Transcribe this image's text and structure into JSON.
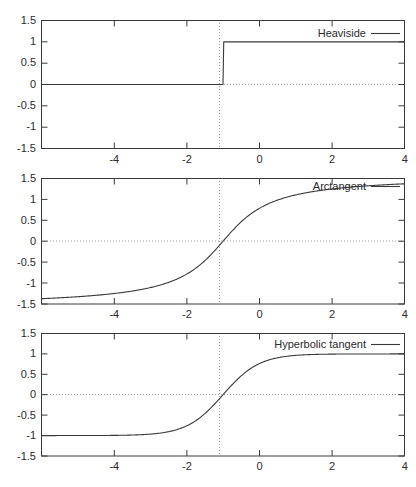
{
  "figure": {
    "width": 416,
    "height": 487,
    "background": "#ffffff",
    "line_color": "#3a3a3a",
    "grid_color": "#9a9a9a",
    "panel_count": 3
  },
  "chart_data": [
    {
      "type": "line",
      "title": "",
      "xlabel": "",
      "ylabel": "",
      "xlim": [
        -5,
        5
      ],
      "ylim": [
        -1.5,
        1.5
      ],
      "xticks": [
        -4,
        -2,
        0,
        2,
        4
      ],
      "xticklabels": [
        "-4",
        "-2",
        "0",
        "2",
        "4"
      ],
      "yticks": [
        -1.5,
        -1,
        -0.5,
        0,
        0.5,
        1,
        1.5
      ],
      "yticklabels": [
        "1.5",
        "1",
        "0.5",
        "0",
        "-0.5",
        "-1",
        "-1.5"
      ],
      "grid": "zero-lines-dotted",
      "legend_position": "top-right",
      "series": [
        {
          "name": "Heaviside",
          "function": "heaviside",
          "x": [
            -5,
            -0.02,
            0,
            0.02,
            5
          ],
          "values": [
            0,
            0,
            0,
            1,
            1
          ]
        }
      ]
    },
    {
      "type": "line",
      "title": "",
      "xlabel": "",
      "ylabel": "",
      "xlim": [
        -5,
        5
      ],
      "ylim": [
        -1.5,
        1.5
      ],
      "xticks": [
        -4,
        -2,
        0,
        2,
        4
      ],
      "xticklabels": [
        "-4",
        "-2",
        "0",
        "2",
        "4"
      ],
      "yticks": [
        -1.5,
        -1,
        -0.5,
        0,
        0.5,
        1,
        1.5
      ],
      "yticklabels": [
        "1.5",
        "1",
        "0.5",
        "0",
        "-0.5",
        "-1",
        "-1.5"
      ],
      "grid": "zero-lines-dotted",
      "legend_position": "top-right",
      "series": [
        {
          "name": "Arctangent",
          "function": "arctan",
          "x": [
            -5,
            -4.5,
            -4,
            -3.5,
            -3,
            -2.5,
            -2,
            -1.5,
            -1,
            -0.75,
            -0.5,
            -0.25,
            0,
            0.25,
            0.5,
            0.75,
            1,
            1.5,
            2,
            2.5,
            3,
            3.5,
            4,
            4.5,
            5
          ],
          "values": [
            -1.373,
            -1.352,
            -1.326,
            -1.292,
            -1.249,
            -1.19,
            -1.107,
            -0.983,
            -0.785,
            -0.644,
            -0.464,
            -0.245,
            0,
            0.245,
            0.464,
            0.644,
            0.785,
            0.983,
            1.107,
            1.19,
            1.249,
            1.292,
            1.326,
            1.352,
            1.373
          ]
        }
      ]
    },
    {
      "type": "line",
      "title": "",
      "xlabel": "",
      "ylabel": "",
      "xlim": [
        -5,
        5
      ],
      "ylim": [
        -1.5,
        1.5
      ],
      "xticks": [
        -4,
        -2,
        0,
        2,
        4
      ],
      "xticklabels": [
        "-4",
        "-2",
        "0",
        "2",
        "4"
      ],
      "yticks": [
        -1.5,
        -1,
        -0.5,
        0,
        0.5,
        1,
        1.5
      ],
      "yticklabels": [
        "1.5",
        "1",
        "0.5",
        "0",
        "-0.5",
        "-1",
        "-1.5"
      ],
      "grid": "zero-lines-dotted",
      "legend_position": "top-right",
      "series": [
        {
          "name": "Hyperbolic tangent",
          "function": "tanh",
          "x": [
            -5,
            -4.5,
            -4,
            -3.5,
            -3,
            -2.5,
            -2,
            -1.5,
            -1,
            -0.75,
            -0.5,
            -0.25,
            0,
            0.25,
            0.5,
            0.75,
            1,
            1.5,
            2,
            2.5,
            3,
            3.5,
            4,
            4.5,
            5
          ],
          "values": [
            -0.9999,
            -0.9998,
            -0.9993,
            -0.9982,
            -0.9951,
            -0.9866,
            -0.964,
            -0.9051,
            -0.7616,
            -0.6351,
            -0.4621,
            -0.2449,
            0,
            0.2449,
            0.4621,
            0.6351,
            0.7616,
            0.9051,
            0.964,
            0.9866,
            0.9951,
            0.9982,
            0.9993,
            0.9998,
            0.9999
          ]
        }
      ]
    }
  ],
  "panels": [
    {
      "id": "panel-heaviside",
      "legend_label": "Heaviside",
      "y_labels": [
        "1.5",
        "1",
        "0.5",
        "0",
        "-0.5",
        "-1",
        "-1.5"
      ],
      "x_labels": [
        "-4",
        "-2",
        "0",
        "2",
        "4"
      ]
    },
    {
      "id": "panel-arctangent",
      "legend_label": "Arctangent",
      "y_labels": [
        "1.5",
        "1",
        "0.5",
        "0",
        "-0.5",
        "-1",
        "-1.5"
      ],
      "x_labels": [
        "-4",
        "-2",
        "0",
        "2",
        "4"
      ]
    },
    {
      "id": "panel-hyperbolic-tangent",
      "legend_label": "Hyperbolic tangent",
      "y_labels": [
        "1.5",
        "1",
        "0.5",
        "0",
        "-0.5",
        "-1",
        "-1.5"
      ],
      "x_labels": [
        "-4",
        "-2",
        "0",
        "2",
        "4"
      ]
    }
  ]
}
